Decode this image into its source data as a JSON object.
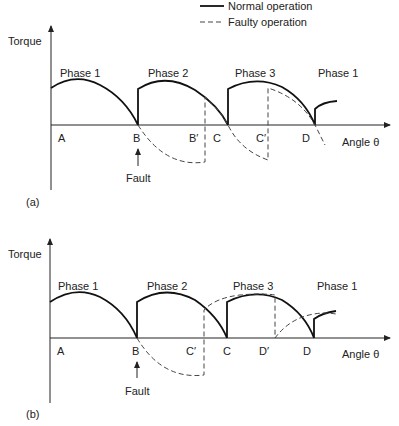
{
  "legend": {
    "normal_label": "Normal operation",
    "faulty_label": "Faulty operation"
  },
  "panels": [
    {
      "id": "a",
      "caption": "(a)",
      "y_label": "Torque",
      "x_label": "Angle θ",
      "phase_labels": [
        "Phase 1",
        "Phase 2",
        "Phase 3",
        "Phase 1"
      ],
      "points": [
        "A",
        "B",
        "B′",
        "C",
        "C′",
        "D"
      ],
      "fault_label": "Fault"
    },
    {
      "id": "b",
      "caption": "(b)",
      "y_label": "Torque",
      "x_label": "Angle θ",
      "phase_labels": [
        "Phase 1",
        "Phase 2",
        "Phase 3",
        "Phase 1"
      ],
      "points": [
        "A",
        "B",
        "C′",
        "C",
        "D′",
        "D"
      ],
      "fault_label": "Fault"
    }
  ],
  "colors": {
    "line": "#111111",
    "background": "#ffffff"
  }
}
